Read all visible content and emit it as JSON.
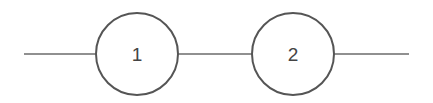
{
  "diagram": {
    "type": "linear-chain",
    "colors": {
      "stroke": "#555555",
      "wire": "#6b6b6b",
      "label": "#444444",
      "background": "#ffffff"
    },
    "nodes": [
      {
        "id": "node-1",
        "label": "1",
        "cx": 137,
        "cy": 54,
        "r": 41
      },
      {
        "id": "node-2",
        "label": "2",
        "cx": 293,
        "cy": 54,
        "r": 41
      }
    ],
    "edges": [
      {
        "id": "lead-in",
        "from": "open-left",
        "to": "node-1",
        "x1": 24,
        "x2": 96,
        "y": 54
      },
      {
        "id": "link-1-2",
        "from": "node-1",
        "to": "node-2",
        "x1": 178,
        "x2": 252,
        "y": 54
      },
      {
        "id": "lead-out",
        "from": "node-2",
        "to": "open-right",
        "x1": 334,
        "x2": 409,
        "y": 54
      }
    ]
  }
}
